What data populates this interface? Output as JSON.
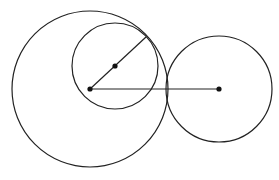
{
  "diagram": {
    "width": 279,
    "height": 180,
    "stroke_color": "#222222",
    "point_color": "#111111",
    "circles": [
      {
        "name": "large-circle",
        "cx": 90,
        "cy": 89,
        "r": 78
      },
      {
        "name": "inner-circle",
        "cx": 115,
        "cy": 66,
        "r": 43
      },
      {
        "name": "right-circle",
        "cx": 219,
        "cy": 89,
        "r": 53
      }
    ],
    "segments": [
      {
        "name": "radius-segment-diagonal",
        "x1": 90,
        "y1": 89,
        "x2": 146,
        "y2": 37
      },
      {
        "name": "center-segment-horizontal",
        "x1": 90,
        "y1": 89,
        "x2": 219,
        "y2": 89
      }
    ],
    "points": [
      {
        "name": "large-circle-center",
        "x": 90,
        "y": 89
      },
      {
        "name": "inner-circle-center",
        "x": 115,
        "y": 66
      },
      {
        "name": "right-circle-center",
        "x": 219,
        "y": 89
      }
    ]
  }
}
